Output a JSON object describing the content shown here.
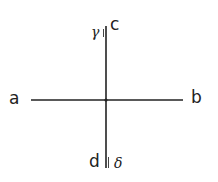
{
  "diagram": {
    "type": "crossed-lines",
    "stroke_color": "#222222",
    "background": "#ffffff",
    "lines": [
      {
        "id": "horizontal",
        "from": "a",
        "to": "b"
      },
      {
        "id": "vertical",
        "from": "c",
        "to": "d"
      }
    ],
    "labels": {
      "a": "a",
      "b": "b",
      "c": "c",
      "d": "d",
      "gamma": "γ",
      "delta": "δ"
    },
    "marks": [
      {
        "id": "top-double-tick",
        "near": "c",
        "annotation": "γ"
      },
      {
        "id": "bottom-double-tick",
        "near": "d",
        "annotation": "δ"
      }
    ]
  }
}
